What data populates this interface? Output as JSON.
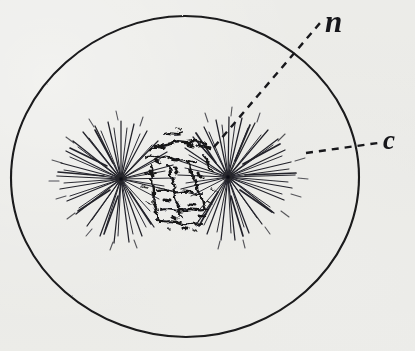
{
  "figure": {
    "background_color": "#f3f3f1",
    "ink_color": "#1a1a1c",
    "caption": ""
  },
  "cell_outline": {
    "name": "cell-wall",
    "label_key": "c",
    "shape": "ellipse",
    "center_x": 185,
    "center_y": 177,
    "radius_x": 174,
    "radius_y": 161,
    "stroke_width": 2.1
  },
  "nucleus": {
    "name": "chromatin-mass",
    "label_key": "n",
    "center_x": 176,
    "center_y": 182,
    "width": 92,
    "height": 92
  },
  "asters": [
    {
      "name": "aster-left",
      "center_x": 121,
      "center_y": 179,
      "ray_count": 78,
      "ray_min_length": 11,
      "ray_max_length": 70
    },
    {
      "name": "aster-right",
      "center_x": 228,
      "center_y": 177,
      "ray_count": 82,
      "ray_min_length": 11,
      "ray_max_length": 68
    }
  ],
  "leaders": [
    {
      "name": "leader-line-n",
      "for_label": "n",
      "x1": 214,
      "y1": 147,
      "x2": 320,
      "y2": 23,
      "dash": "7 6"
    },
    {
      "name": "leader-line-c",
      "for_label": "c",
      "x1": 306,
      "y1": 153,
      "x2": 378,
      "y2": 143,
      "dash": "7 6"
    }
  ],
  "labels": {
    "n": "n",
    "c": "c"
  }
}
